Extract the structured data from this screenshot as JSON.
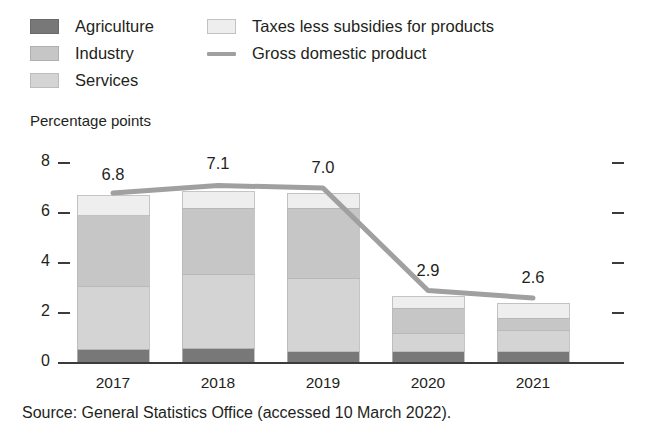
{
  "axis_title": "Percentage points",
  "source_note": "Source: General Statistics Office (accessed 10 March 2022).",
  "legend": {
    "column_1": [
      {
        "label": "Agriculture",
        "swatch": "agriculture-swatch",
        "color": "#787878"
      },
      {
        "label": "Industry",
        "swatch": "industry-swatch",
        "color": "#c6c6c6"
      },
      {
        "label": "Services",
        "swatch": "services-swatch",
        "color": "#d4d4d4"
      }
    ],
    "column_2": [
      {
        "label": "Taxes less subsidies for products",
        "swatch": "taxes-swatch",
        "color": "#eeeeee"
      },
      {
        "label": "Gross domestic product",
        "swatch": "gdp-line-swatch",
        "color": "#a0a0a0"
      }
    ]
  },
  "chart_data": {
    "type": "bar",
    "subtype": "stacked-bar-with-line-overlay",
    "title": "",
    "xlabel": "",
    "ylabel": "Percentage points",
    "categories": [
      "2017",
      "2018",
      "2019",
      "2020",
      "2021"
    ],
    "ylim": [
      0,
      8
    ],
    "yticks": [
      0,
      2,
      4,
      6,
      8
    ],
    "ytick_labels": [
      "0",
      "2",
      "4",
      "6",
      "8"
    ],
    "grid": false,
    "legend_position": "top",
    "series": [
      {
        "name": "Agriculture",
        "type": "bar",
        "color": "#787878",
        "values": [
          0.55,
          0.6,
          0.45,
          0.45,
          0.45
        ]
      },
      {
        "name": "Services",
        "type": "bar",
        "color": "#d4d4d4",
        "values": [
          2.5,
          2.95,
          2.95,
          0.75,
          0.85
        ]
      },
      {
        "name": "Industry",
        "type": "bar",
        "color": "#c6c6c6",
        "values": [
          2.85,
          2.65,
          2.8,
          1.0,
          0.5
        ]
      },
      {
        "name": "Taxes less subsidies for products",
        "type": "bar",
        "color": "#eeeeee",
        "values": [
          0.8,
          0.65,
          0.6,
          0.45,
          0.6
        ]
      },
      {
        "name": "Gross domestic product",
        "type": "line",
        "color": "#a0a0a0",
        "values": [
          6.8,
          7.1,
          7.0,
          2.9,
          2.6
        ]
      }
    ],
    "data_labels": [
      "6.8",
      "7.1",
      "7.0",
      "2.9",
      "2.6"
    ]
  }
}
